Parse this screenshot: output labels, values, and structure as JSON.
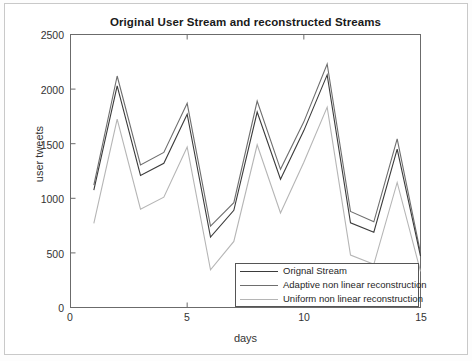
{
  "figure": {
    "title": "Original User Stream and reconstructed Streams",
    "xlabel": "days",
    "ylabel": "user tweets"
  },
  "axes": {
    "y_ticks": [
      "0",
      "500",
      "1000",
      "1500",
      "2000",
      "2500"
    ],
    "x_ticks": [
      "0",
      "5",
      "10",
      "15"
    ]
  },
  "legend": {
    "items": [
      {
        "label": "Orignal Stream",
        "color": "#3b3b3b"
      },
      {
        "label": "Adaptive non linear reconstruction",
        "color": "#6e6e6e"
      },
      {
        "label": "Uniform non linear reconstruction",
        "color": "#b5b5b5"
      }
    ]
  },
  "chart_data": {
    "type": "line",
    "title": "Original User Stream and reconstructed Streams",
    "xlabel": "days",
    "ylabel": "user tweets",
    "xlim": [
      0,
      15
    ],
    "ylim": [
      0,
      2500
    ],
    "xticks": [
      0,
      5,
      10,
      15
    ],
    "yticks": [
      0,
      500,
      1000,
      1500,
      2000,
      2500
    ],
    "grid": false,
    "legend_position": "lower right",
    "x": [
      1,
      2,
      3,
      4,
      5,
      6,
      7,
      8,
      9,
      10,
      11,
      12,
      13,
      14,
      15
    ],
    "series": [
      {
        "name": "Orignal Stream",
        "color": "#3b3b3b",
        "values": [
          1075,
          2030,
          1210,
          1320,
          1770,
          645,
          890,
          1790,
          1175,
          1620,
          2130,
          775,
          690,
          1450,
          470
        ]
      },
      {
        "name": "Adaptive non linear reconstruction",
        "color": "#6e6e6e",
        "values": [
          1120,
          2120,
          1305,
          1420,
          1870,
          745,
          960,
          1890,
          1265,
          1700,
          2230,
          880,
          785,
          1545,
          500
        ]
      },
      {
        "name": "Uniform non linear reconstruction",
        "color": "#b5b5b5",
        "values": [
          770,
          1725,
          900,
          1010,
          1470,
          345,
          605,
          1490,
          865,
          1330,
          1835,
          480,
          395,
          1145,
          330
        ]
      }
    ]
  }
}
